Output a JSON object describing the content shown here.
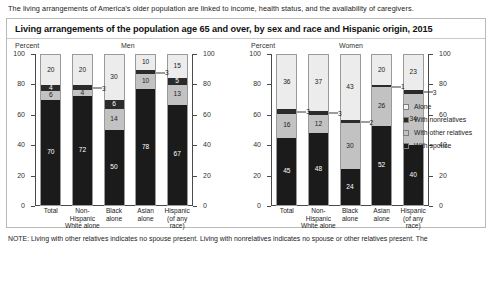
{
  "intro": "The living arrangements of America’s older population are linked to income, health status, and the availability of caregivers.",
  "panel": {
    "title": "Living arrangements of the population age 65 and over, by sex and race and Hispanic origin, 2015"
  },
  "note": "NOTE: Living with other relatives indicates no spouse present. Living with nonrelatives indicates no spouse or other relatives present. The",
  "legend": {
    "items": [
      {
        "label": "Alone",
        "key": "alone",
        "color": "#ececec"
      },
      {
        "label": "With nonrelatives",
        "key": "nonrel",
        "color": "#2b2b2b"
      },
      {
        "label": "With other relatives",
        "key": "otherrel",
        "color": "#c2c2c2"
      },
      {
        "label": "With spouse",
        "key": "spouse",
        "color": "#1b1b1b"
      }
    ]
  },
  "chart_data": [
    {
      "type": "bar",
      "subtype": "stacked-column",
      "title": "Men",
      "ylabel": "Percent",
      "xlabel": "",
      "ylim": [
        0,
        100
      ],
      "yticks": [
        0,
        20,
        40,
        60,
        80,
        100
      ],
      "grid": false,
      "legend_position": "right",
      "categories": [
        "Total",
        "Non-Hispanic White alone",
        "Black alone",
        "Asian alone",
        "Hispanic (of any race)"
      ],
      "category_lines": [
        [
          "Total"
        ],
        [
          "Non-",
          "Hispanic",
          "White alone"
        ],
        [
          "Black",
          "alone"
        ],
        [
          "Asian",
          "alone"
        ],
        [
          "Hispanic",
          "(of any",
          "race)"
        ]
      ],
      "series": [
        {
          "name": "With spouse",
          "key": "spouse",
          "values": [
            70,
            72,
            50,
            78,
            67
          ]
        },
        {
          "name": "With other relatives",
          "key": "otherrel",
          "values": [
            6,
            4,
            14,
            10,
            13
          ]
        },
        {
          "name": "With nonrelatives",
          "key": "nonrel",
          "values": [
            4,
            3,
            6,
            3,
            5
          ]
        },
        {
          "name": "Alone",
          "key": "alone",
          "values": [
            20,
            20,
            30,
            10,
            15
          ]
        }
      ],
      "callouts": [
        {
          "category_index": 1,
          "key": "nonrel",
          "value": 3
        },
        {
          "category_index": 3,
          "key": "nonrel",
          "value": 3
        }
      ]
    },
    {
      "type": "bar",
      "subtype": "stacked-column",
      "title": "Women",
      "ylabel": "Percent",
      "xlabel": "",
      "ylim": [
        0,
        100
      ],
      "yticks": [
        0,
        20,
        40,
        60,
        80,
        100
      ],
      "grid": false,
      "legend_position": "right",
      "categories": [
        "Total",
        "Non-Hispanic White alone",
        "Black alone",
        "Asian alone",
        "Hispanic (of any race)"
      ],
      "category_lines": [
        [
          "Total"
        ],
        [
          "Non-",
          "Hispanic",
          "White alone"
        ],
        [
          "Black",
          "alone"
        ],
        [
          "Asian",
          "alone"
        ],
        [
          "Hispanic",
          "(of any",
          "race)"
        ]
      ],
      "series": [
        {
          "name": "With spouse",
          "key": "spouse",
          "values": [
            45,
            48,
            24,
            52,
            40
          ]
        },
        {
          "name": "With other relatives",
          "key": "otherrel",
          "values": [
            16,
            12,
            30,
            26,
            34
          ]
        },
        {
          "name": "With nonrelatives",
          "key": "nonrel",
          "values": [
            3,
            3,
            2,
            1,
            3
          ]
        },
        {
          "name": "Alone",
          "key": "alone",
          "values": [
            36,
            37,
            43,
            20,
            23
          ]
        }
      ],
      "callouts": [
        {
          "category_index": 0,
          "key": "nonrel",
          "value": 3
        },
        {
          "category_index": 1,
          "key": "nonrel",
          "value": 3
        },
        {
          "category_index": 2,
          "key": "nonrel",
          "value": 2
        },
        {
          "category_index": 3,
          "key": "nonrel",
          "value": 1
        },
        {
          "category_index": 4,
          "key": "nonrel",
          "value": 3
        }
      ]
    }
  ]
}
